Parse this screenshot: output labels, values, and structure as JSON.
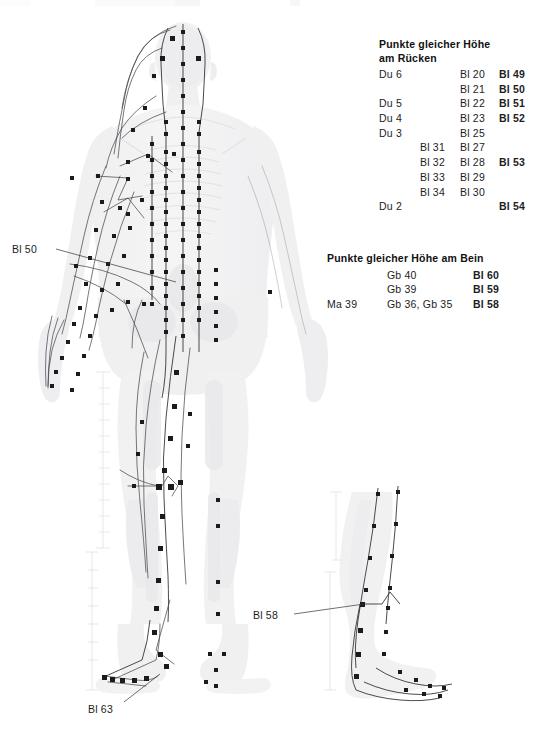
{
  "figure": {
    "main_view_label": "back-view-body",
    "inset_view_label": "leg-lateral-inset"
  },
  "back_panel": {
    "title_line1": "Punkte gleicher Höhe",
    "title_line2": "am Rücken",
    "rows": [
      {
        "c1": "Du 6",
        "c2": "",
        "c3": "Bl 20",
        "c4": "Bl 49"
      },
      {
        "c1": "",
        "c2": "",
        "c3": "Bl 21",
        "c4": "Bl 50"
      },
      {
        "c1": "Du 5",
        "c2": "",
        "c3": "Bl 22",
        "c4": "Bl 51"
      },
      {
        "c1": "Du 4",
        "c2": "",
        "c3": "Bl 23",
        "c4": "Bl 52"
      },
      {
        "c1": "Du 3",
        "c2": "",
        "c3": "Bl 25",
        "c4": ""
      },
      {
        "c1": "",
        "c2": "Bl 31",
        "c3": "Bl 27",
        "c4": ""
      },
      {
        "c1": "",
        "c2": "Bl 32",
        "c3": "Bl 28",
        "c4": "Bl 53"
      },
      {
        "c1": "",
        "c2": "Bl 33",
        "c3": "Bl 29",
        "c4": ""
      },
      {
        "c1": "",
        "c2": "Bl 34",
        "c3": "Bl 30",
        "c4": ""
      },
      {
        "c1": "Du 2",
        "c2": "",
        "c3": "",
        "c4": "Bl 54"
      }
    ]
  },
  "leg_panel": {
    "title": "Punkte gleicher Höhe am Bein",
    "rows": [
      {
        "c1": "",
        "c2": "Gb 40",
        "c3": "Bl 60"
      },
      {
        "c1": "",
        "c2": "Gb 39",
        "c3": "Bl 59"
      },
      {
        "c1": "Ma 39",
        "c2": "Gb 36, Gb 35",
        "c3": "Bl 58"
      }
    ]
  },
  "callouts": {
    "bl50": "Bl 50",
    "bl58": "Bl 58",
    "bl63": "Bl 63"
  },
  "colors": {
    "text": "#1d1d1d",
    "bold_text": "#000000",
    "body_fill": "#f2f2f3",
    "body_shade": "#e6e6e8",
    "point": "#1b1b1b",
    "meridian": "#4a4a52",
    "leader": "#333333",
    "background": "#ffffff"
  }
}
